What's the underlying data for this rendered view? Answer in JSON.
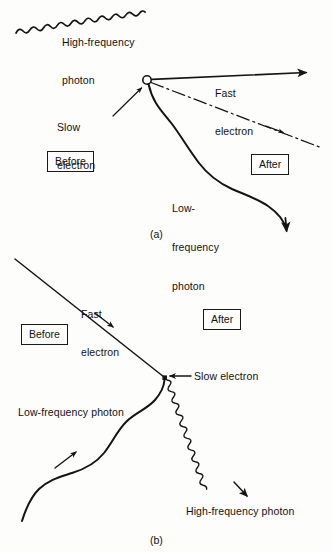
{
  "figure": {
    "background_color": "#fdfdfb",
    "ink_color": "#141414"
  },
  "panel_a": {
    "caption": "(a)",
    "labels": {
      "incoming_photon": "High-frequency\nphoton",
      "incoming_photon_line1": "High-frequency",
      "incoming_photon_line2": "photon",
      "outgoing_electron": "Fast\nelectron",
      "outgoing_electron_line1": "Fast",
      "outgoing_electron_line2": "electron",
      "incoming_electron": "Slow\nelectron",
      "incoming_electron_line1": "Slow",
      "incoming_electron_line2": "electron",
      "outgoing_photon": "Low-\nfrequency\nphoton",
      "outgoing_photon_line1": "Low-",
      "outgoing_photon_line2": "frequency",
      "outgoing_photon_line3": "photon",
      "before": "Before",
      "after": "After"
    }
  },
  "panel_b": {
    "caption": "(b)",
    "labels": {
      "incoming_electron": "Fast\nelectron",
      "incoming_electron_line1": "Fast",
      "incoming_electron_line2": "electron",
      "outgoing_electron": "Slow electron",
      "incoming_photon": "Low-frequency photon",
      "outgoing_photon": "High-frequency photon",
      "before": "Before",
      "after": "After"
    }
  }
}
